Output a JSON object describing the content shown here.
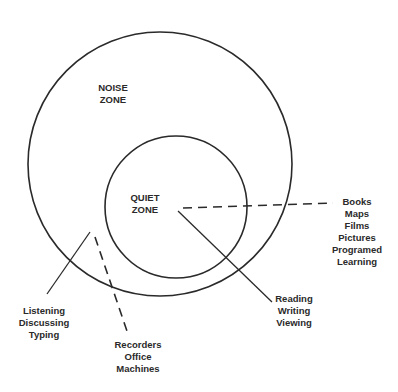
{
  "diagram": {
    "outer_zone": {
      "label_lines": [
        "NOISE",
        "ZONE"
      ]
    },
    "inner_zone": {
      "label_lines": [
        "QUIET",
        "ZONE"
      ]
    },
    "callouts": {
      "media": {
        "lines": [
          "Books",
          "Maps",
          "Films",
          "Pictures",
          "Programed",
          "Learning"
        ],
        "line_style": "dashed"
      },
      "quiet_activities": {
        "lines": [
          "Reading",
          "Writing",
          "Viewing"
        ],
        "line_style": "solid"
      },
      "noise_activities": {
        "lines": [
          "Listening",
          "Discussing",
          "Typing"
        ],
        "line_style": "solid"
      },
      "noise_equipment": {
        "lines": [
          "Recorders",
          "Office",
          "Machines"
        ],
        "line_style": "dashed"
      }
    },
    "colors": {
      "stroke": "#2a2a2a",
      "background": "#ffffff"
    }
  }
}
